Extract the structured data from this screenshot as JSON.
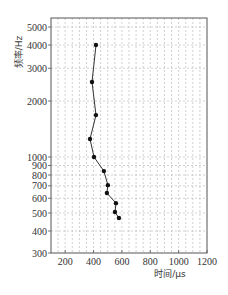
{
  "chart_data": {
    "type": "line",
    "title": "",
    "xlabel": "时间/μs",
    "ylabel": "频率/Hz",
    "xlim": [
      100,
      1200
    ],
    "ylim": [
      300,
      5560
    ],
    "yscale": "log",
    "grid": true,
    "legend": null,
    "x_ticks": [
      200,
      400,
      600,
      800,
      1000,
      1200
    ],
    "y_ticks": [
      300,
      400,
      500,
      600,
      700,
      800,
      900,
      1000,
      2000,
      3000,
      4000,
      5000
    ],
    "y_grid": [
      400,
      500,
      600,
      700,
      800,
      900,
      1000,
      2000,
      3000,
      4000,
      5000
    ],
    "x_grid_step": 50,
    "series": [
      {
        "name": "frequency-time",
        "marker": "circle",
        "color": "#222222",
        "points": [
          {
            "x": 417,
            "y": 4000
          },
          {
            "x": 389,
            "y": 2530
          },
          {
            "x": 417,
            "y": 1680
          },
          {
            "x": 375,
            "y": 1250
          },
          {
            "x": 403,
            "y": 1000
          },
          {
            "x": 473,
            "y": 840
          },
          {
            "x": 501,
            "y": 706
          },
          {
            "x": 494,
            "y": 640
          },
          {
            "x": 558,
            "y": 565
          },
          {
            "x": 551,
            "y": 506
          },
          {
            "x": 579,
            "y": 470
          }
        ]
      }
    ]
  },
  "colors": {
    "axis": "#555555",
    "grid": "#b0b0b0",
    "line": "#333333",
    "marker": "#111111"
  }
}
